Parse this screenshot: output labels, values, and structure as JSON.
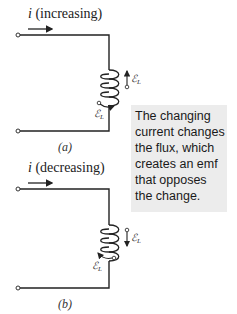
{
  "panel_a": {
    "current_symbol": "i",
    "current_label": "(increasing)",
    "caption": "(a)",
    "emf_label": "ℰL",
    "emf_direction": "up"
  },
  "panel_b": {
    "current_symbol": "i",
    "current_label": "(decreasing)",
    "caption": "(b)",
    "emf_label": "ℰL",
    "emf_direction": "down"
  },
  "note": {
    "lines": [
      "The changing",
      "current changes",
      "the flux, which",
      "creates an emf",
      "that opposes",
      "the change."
    ],
    "background": "#ececec"
  }
}
